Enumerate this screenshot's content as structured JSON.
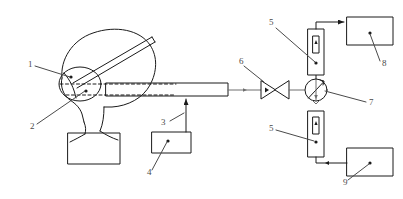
{
  "diagram": {
    "type": "schematic",
    "background_color": "#ffffff",
    "line_color": "#1a1a1a",
    "label_color": "#4a4a4a",
    "labels": [
      {
        "id": "1",
        "text": "1",
        "x": 28,
        "y": 67,
        "points_to": "mask-upper-port"
      },
      {
        "id": "2",
        "text": "2",
        "x": 30,
        "y": 129,
        "points_to": "mask-lower-port"
      },
      {
        "id": "3",
        "text": "3",
        "x": 161,
        "y": 125,
        "points_to": "sampling-probe-tube"
      },
      {
        "id": "4",
        "text": "4",
        "x": 147,
        "y": 175,
        "points_to": "control-box-4"
      },
      {
        "id": "5",
        "text": "5",
        "x": 269,
        "y": 25,
        "points_to": "detector-cell-upper"
      },
      {
        "id": "6",
        "text": "6",
        "x": 239,
        "y": 64,
        "points_to": "valve"
      },
      {
        "id": "7",
        "text": "7",
        "x": 369,
        "y": 105,
        "points_to": "optical-switch"
      },
      {
        "id": "5b",
        "text": "5",
        "x": 269,
        "y": 131,
        "points_to": "detector-cell-lower"
      },
      {
        "id": "8",
        "text": "8",
        "x": 382,
        "y": 66,
        "points_to": "analyzer-box-8"
      },
      {
        "id": "9",
        "text": "9",
        "x": 343,
        "y": 185,
        "points_to": "analyzer-box-9"
      }
    ],
    "components": {
      "head": "human-head-profile",
      "mask": "breathing-mask-oval",
      "strap": "mask-strap",
      "shoulder": "shoulder-block",
      "probe": "sampling-probe-tube",
      "box4": "control-box-4",
      "valve": "flow-valve",
      "switch": "optical-switch",
      "cell_upper": "detector-cell-upper",
      "cell_lower": "detector-cell-lower",
      "box8": "analyzer-box-8",
      "box9": "analyzer-box-9"
    }
  }
}
